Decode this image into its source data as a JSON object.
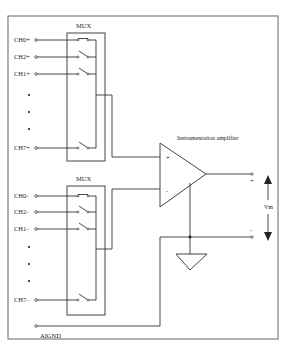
{
  "diagram": {
    "upper_mux": {
      "label": "MUX",
      "channels": [
        {
          "label": "CH0+",
          "y": 40
        },
        {
          "label": "CH2+",
          "y": 57
        },
        {
          "label": "CH1+",
          "y": 74
        },
        {
          "label": "CH7+",
          "y": 148
        }
      ],
      "ellipsis_dots_y": [
        95,
        112,
        129
      ]
    },
    "lower_mux": {
      "label": "MUX",
      "channels": [
        {
          "label": "CH0-",
          "y": 196
        },
        {
          "label": "CH2-",
          "y": 212
        },
        {
          "label": "CH1-",
          "y": 229
        },
        {
          "label": "CH7-",
          "y": 300
        }
      ],
      "ellipsis_dots_y": [
        247,
        264,
        281
      ]
    },
    "amplifier": {
      "label": "Instrumentation amplifier",
      "plus_input": "+",
      "minus_input": "-"
    },
    "output": {
      "plus_label": "+",
      "minus_label": "-",
      "voltage_label": "Vm"
    },
    "ground_label": "AIGND"
  }
}
